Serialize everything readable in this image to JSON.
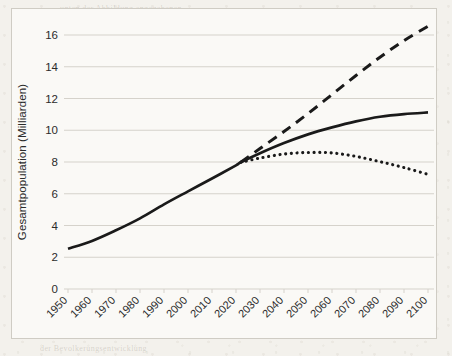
{
  "chart_data": {
    "type": "line",
    "title": "",
    "xlabel": "",
    "ylabel": "Gesamtpopulation (Milliarden)",
    "xlim": [
      1950,
      2100
    ],
    "ylim": [
      0,
      16
    ],
    "grid": true,
    "legend": "none",
    "x_ticks": [
      "1950",
      "1960",
      "1970",
      "1980",
      "1990",
      "2000",
      "2010",
      "2020",
      "2030",
      "2040",
      "2050",
      "2060",
      "2070",
      "2080",
      "2090",
      "2100"
    ],
    "y_ticks": [
      "0",
      "2",
      "4",
      "6",
      "8",
      "10",
      "12",
      "14",
      "16"
    ],
    "x": [
      1950,
      1960,
      1970,
      1980,
      1990,
      2000,
      2010,
      2020,
      2022,
      2030,
      2040,
      2050,
      2060,
      2070,
      2080,
      2090,
      2100
    ],
    "series": [
      {
        "name": "Mittlere Variante",
        "style": "solid",
        "color": "#1a1a1a",
        "values": [
          2.54,
          3.03,
          3.7,
          4.45,
          5.33,
          6.15,
          6.96,
          7.79,
          7.98,
          8.55,
          9.19,
          9.74,
          10.18,
          10.56,
          10.85,
          11.02,
          11.12
        ]
      },
      {
        "name": "Hohe Variante",
        "style": "dashed",
        "color": "#1a1a1a",
        "values": [
          null,
          null,
          null,
          null,
          null,
          null,
          null,
          null,
          7.98,
          8.85,
          9.92,
          11.05,
          12.25,
          13.45,
          14.6,
          15.65,
          16.55
        ]
      },
      {
        "name": "Niedrige Variante",
        "style": "dotted",
        "color": "#1a1a1a",
        "values": [
          null,
          null,
          null,
          null,
          null,
          null,
          null,
          null,
          7.98,
          8.25,
          8.5,
          8.6,
          8.57,
          8.35,
          8.02,
          7.65,
          7.22
        ]
      }
    ],
    "annotations": []
  },
  "figure": {
    "background_color": "#f3f1ec",
    "frame_color": "#cfccc4",
    "grid_color": "#d5d2cb",
    "ink_color": "#1a1a1a"
  },
  "bleed_through": {
    "lines": [
      "unten der Abbildung angegebenen",
      "Anteil der Weltbevolkerung in den",
      "Regionen mit hoher Fertilitat",
      "und die Prognose der Vereinten",
      "Nationen fur die kommenden",
      "Jahrzehnte bis zum Jahr 2100",
      "zeigt die mittlere Variante",
      "der Bevolkerungsentwicklung"
    ]
  }
}
